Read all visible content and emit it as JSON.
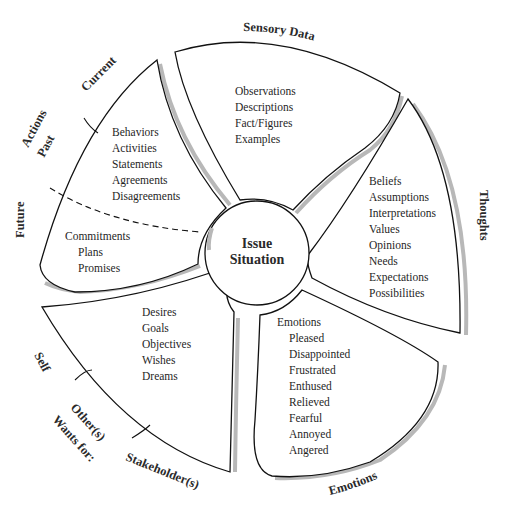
{
  "diagram": {
    "center": {
      "line1": "Issue",
      "line2": "Situation"
    },
    "petals": [
      {
        "id": "sensory",
        "label": "Sensory Data",
        "items": [
          "Observations",
          "Descriptions",
          "Fact/Figures",
          "Examples"
        ]
      },
      {
        "id": "thoughts",
        "label": "Thoughts",
        "items": [
          "Beliefs",
          "Assumptions",
          "Interpretations",
          "Values",
          "Opinions",
          "Needs",
          "Expectations",
          "Possibilities"
        ]
      },
      {
        "id": "emotions",
        "label": "Emotions",
        "header": "Emotions",
        "items": [
          "Pleased",
          "Disappointed",
          "Frustrated",
          "Enthused",
          "Relieved",
          "Fearful",
          "Annoyed",
          "Angered"
        ]
      },
      {
        "id": "wants",
        "label": "Wants for:",
        "sublabels": [
          "Self",
          "Other(s)",
          "Stakeholder(s)"
        ],
        "items": [
          "Desires",
          "Goals",
          "Objectives",
          "Wishes",
          "Dreams"
        ]
      },
      {
        "id": "actions",
        "label": "Actions",
        "sublabels": [
          "Current",
          "Past",
          "Future"
        ],
        "items_past_current": [
          "Behaviors",
          "Activities",
          "Statements",
          "Agreements",
          "Disagreements"
        ],
        "items_future": [
          "Commitments",
          "Plans",
          "Promises"
        ]
      }
    ]
  }
}
